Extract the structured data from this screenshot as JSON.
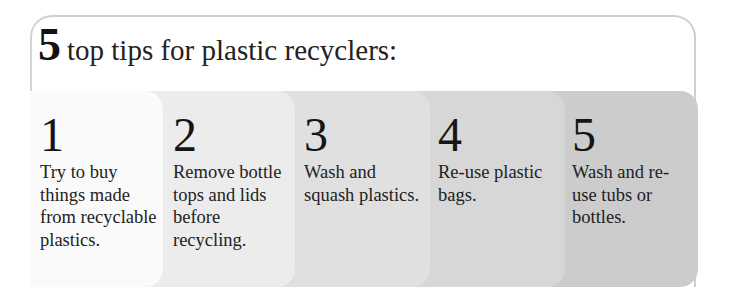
{
  "title": {
    "number": "5",
    "text": "top tips for plastic recyclers:"
  },
  "colors": {
    "frame_border": "#cfcfcf",
    "card_1": "#fafafa",
    "card_2": "#ececec",
    "card_3": "#e0e0e0",
    "card_4": "#d7d7d7",
    "card_5": "#cccccc",
    "text": "#1c1c1c"
  },
  "tips": [
    {
      "number": "1",
      "text": "Try to buy things made from recyclable plastics."
    },
    {
      "number": "2",
      "text": "Remove bottle tops and lids before recycling."
    },
    {
      "number": "3",
      "text": "Wash and squash plastics."
    },
    {
      "number": "4",
      "text": "Re-use plastic bags."
    },
    {
      "number": "5",
      "text": "Wash and re-use tubs or bottles."
    }
  ]
}
